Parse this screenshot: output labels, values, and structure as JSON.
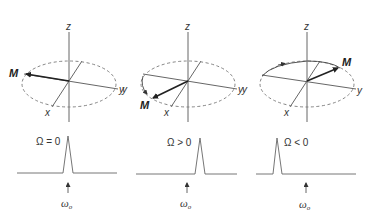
{
  "figure": {
    "panels": [
      {
        "id": "on-resonance",
        "axis_labels": {
          "z": "z",
          "x": "x",
          "y": "y"
        },
        "vector_label": "M",
        "condition": "Ω = 0",
        "reference_label": "ω",
        "reference_subscript": "o",
        "rotation": "none"
      },
      {
        "id": "positive-offset",
        "axis_labels": {
          "z": "z",
          "x": "x",
          "y": "y",
          "y_neg": "y"
        },
        "vector_label": "M",
        "condition": "Ω > 0",
        "reference_label": "ω",
        "reference_subscript": "o",
        "rotation": "counterclockwise"
      },
      {
        "id": "negative-offset",
        "axis_labels": {
          "z": "z",
          "x": "x",
          "y": "y",
          "y_neg": "y"
        },
        "vector_label": "M",
        "condition": "Ω < 0",
        "reference_label": "ω",
        "reference_subscript": "o",
        "rotation": "clockwise"
      }
    ],
    "colors": {
      "line": "#555555",
      "dashed": "#777777",
      "vector": "#222222",
      "background": "#ffffff"
    }
  }
}
